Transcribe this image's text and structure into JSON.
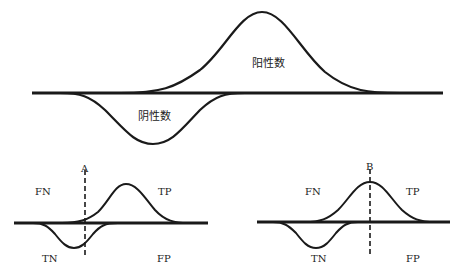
{
  "top_diagram": {
    "positive_label": "阳性数",
    "negative_label": "阴性数"
  },
  "bottom_left": {
    "threshold_label": "A",
    "fn_label": "FN",
    "tp_label": "TP",
    "tn_label": "TN",
    "fp_label": "FP"
  },
  "bottom_right": {
    "threshold_label": "B",
    "fn_label": "FN",
    "tp_label": "TP",
    "tn_label": "TN",
    "fp_label": "FP"
  },
  "colors": {
    "stroke": "#1a1a1a",
    "background": "#ffffff"
  }
}
